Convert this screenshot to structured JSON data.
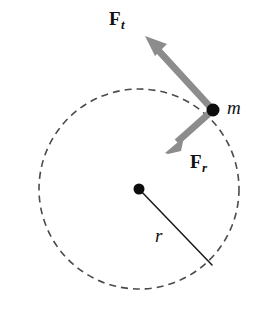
{
  "figure": {
    "background_color": "#ffffff"
  },
  "labels": {
    "tangential_force": "F",
    "tangential_force_subscript": "t",
    "radial_force": "F",
    "radial_force_subscript": "r",
    "mass": "m",
    "radius": "r"
  },
  "colors": {
    "arrow": "#8c8c8c",
    "circle_stroke": "#4a4a50",
    "radius_line": "#1a1a1a",
    "dot": "#0d0d0d",
    "text": "#111111"
  },
  "geometry": {
    "circle": {
      "cx": 139,
      "cy": 189,
      "r": 100,
      "dash": "7 5",
      "stroke_width": 1.6
    },
    "center_dot": {
      "cx": 139,
      "cy": 189,
      "r": 5.5
    },
    "particle_dot": {
      "cx": 213,
      "cy": 110,
      "r": 6.5
    },
    "radius_line": {
      "x1": 139,
      "y1": 189,
      "x2": 212,
      "y2": 265,
      "stroke_width": 1.5
    },
    "tangential_arrow": {
      "x1": 213,
      "y1": 110,
      "x2": 147,
      "y2": 38,
      "stroke_width": 7
    },
    "radial_arrow": {
      "x1": 213,
      "y1": 110,
      "x2": 169,
      "y2": 149,
      "stroke_width": 7
    }
  }
}
